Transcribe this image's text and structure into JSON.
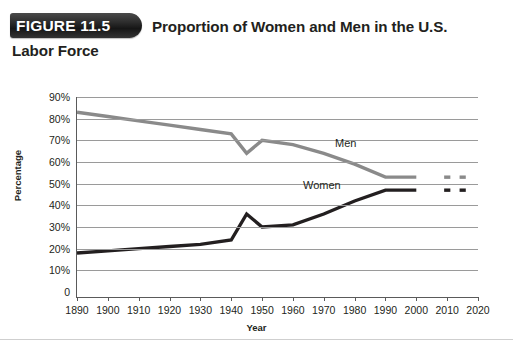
{
  "figure": {
    "badge": "FIGURE 11.5",
    "title_line1": "Proportion of Women and Men in the U.S.",
    "title_line2": "Labor Force"
  },
  "colors": {
    "men_line": "#8a8a8a",
    "women_line": "#231f20",
    "gridline": "#9a9a9a",
    "axis": "#5a5a5a",
    "text": "#231f20",
    "banner_bg": "#1d1d1d"
  },
  "chart_data": {
    "type": "line",
    "title": "Proportion of Women and Men in the U.S. Labor Force",
    "xlabel": "Year",
    "ylabel": "Percentage",
    "xlim": [
      1890,
      2020
    ],
    "ylim": [
      0,
      90
    ],
    "grid": true,
    "legend": "inline-labels",
    "x_ticks": [
      1890,
      1900,
      1910,
      1920,
      1930,
      1940,
      1950,
      1960,
      1970,
      1980,
      1990,
      2000,
      2010,
      2020
    ],
    "y_ticks": [
      0,
      10,
      20,
      30,
      40,
      50,
      60,
      70,
      80,
      90
    ],
    "y_tick_labels": [
      "0",
      "10%",
      "20%",
      "30%",
      "40%",
      "50%",
      "60%",
      "70%",
      "80%",
      "90%"
    ],
    "x": [
      1890,
      1900,
      1910,
      1920,
      1930,
      1940,
      1945,
      1950,
      1960,
      1970,
      1980,
      1990,
      2000
    ],
    "series": [
      {
        "name": "Men",
        "label": "Men",
        "color": "#8a8a8a",
        "values": [
          83,
          81,
          79,
          77,
          75,
          73,
          64,
          70,
          68,
          64,
          59,
          53,
          53
        ],
        "projected": [
          53,
          53
        ]
      },
      {
        "name": "Women",
        "label": "Women",
        "color": "#231f20",
        "values": [
          18,
          19,
          20,
          21,
          22,
          24,
          36,
          30,
          31,
          36,
          42,
          47,
          47
        ],
        "projected": [
          47,
          47
        ]
      }
    ],
    "projection_x": [
      2010,
      2015
    ]
  }
}
